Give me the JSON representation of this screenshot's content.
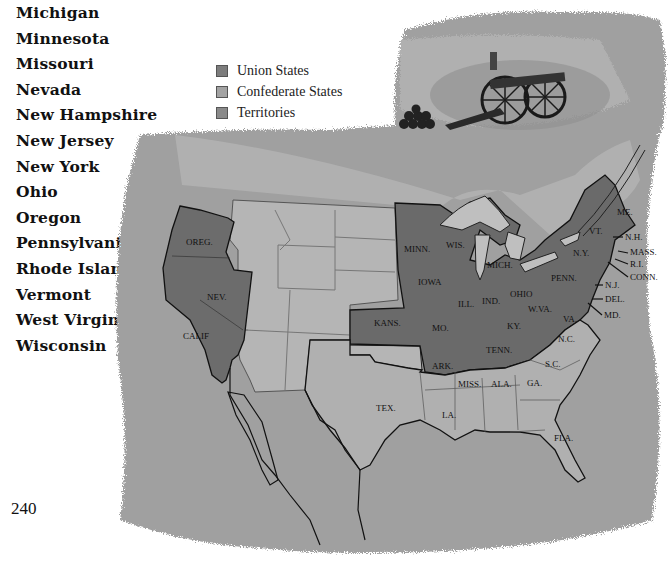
{
  "state_list": {
    "items": [
      "Michigan",
      "Minnesota",
      "Missouri",
      "Nevada",
      "New Hampshire",
      "New Jersey",
      "New York",
      "Ohio",
      "Oregon",
      "Pennsylvania",
      "Rhode Island",
      "Vermont",
      "West Virginia",
      "Wisconsin"
    ]
  },
  "page_number": "240",
  "legend": {
    "items": [
      {
        "label": "Union States",
        "color": "#7d7d7d"
      },
      {
        "label": "Confederate States",
        "color": "#a3a3a3"
      },
      {
        "label": "Territories",
        "color": "#8a8a8a"
      }
    ]
  },
  "colors": {
    "union": "#6e6e6e",
    "confederate": "#b2b2b2",
    "territories": "#b8b8b8",
    "background_wash": "#9d9d9d",
    "border": "#1a1a1a"
  },
  "map": {
    "labels": {
      "oreg": "OREG.",
      "nev": "NEV.",
      "calif": "CALIF",
      "minn": "MINN.",
      "wis": "WIS.",
      "iowa": "IOWA",
      "mich": "MICH.",
      "ill": "ILL.",
      "ind": "IND.",
      "ohio": "OHIO",
      "kans": "KANS.",
      "mo": "MO.",
      "ky": "KY.",
      "wva": "W.VA.",
      "penn": "PENN.",
      "ny": "N.Y.",
      "vt": "VT.",
      "me": "ME.",
      "nh": "N.H.",
      "mass": "MASS.",
      "ri": "R.I.",
      "conn": "CONN.",
      "nj": "N.J.",
      "del": "DEL.",
      "md": "MD.",
      "va": "VA.",
      "nc": "N.C.",
      "sc": "S.C.",
      "tenn": "TENN.",
      "ark": "ARK.",
      "miss": "MISS.",
      "ala": "ALA.",
      "ga": "GA.",
      "la": "LA.",
      "tex": "TEX.",
      "fla": "FLA."
    }
  }
}
